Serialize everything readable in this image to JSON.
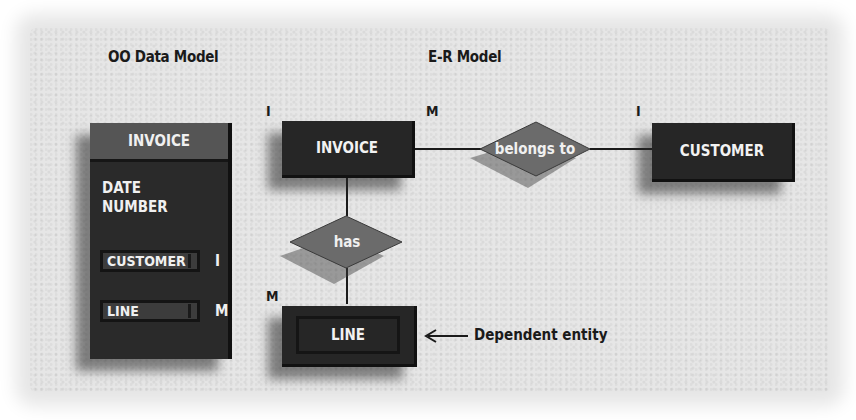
{
  "headings": {
    "oo_model": "OO Data Model",
    "er_model": "E-R Model"
  },
  "oo_model": {
    "class_name": "INVOICE",
    "attributes": [
      "DATE",
      "NUMBER"
    ],
    "references": [
      {
        "name": "CUSTOMER",
        "cardinality": "I"
      },
      {
        "name": "LINE",
        "cardinality": "M"
      }
    ]
  },
  "er_model": {
    "entities": {
      "invoice": "INVOICE",
      "customer": "CUSTOMER",
      "line": "LINE"
    },
    "relationships": {
      "belongs_to": "belongs to",
      "has": "has"
    },
    "cardinalities": {
      "invoice_left": "I",
      "invoice_right": "M",
      "customer": "I",
      "line": "M"
    },
    "annotation": {
      "arrow_icon": "left-arrow-icon",
      "text": "Dependent entity"
    }
  },
  "colors": {
    "background": "#e6e6e6",
    "entity_fill": "#262626",
    "diamond_fill": "#6b6b6b",
    "oo_header_fill": "#555555",
    "text_dark": "#1a1a1a",
    "text_light": "#f0f0f0"
  }
}
